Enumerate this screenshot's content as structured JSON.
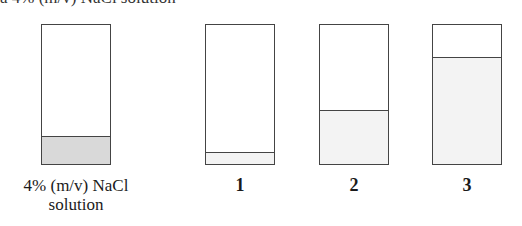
{
  "header": {
    "caption": "a 4% (m/v) NaCl solution"
  },
  "colors": {
    "outline": "#444444",
    "fill_reference": "#d9d9d9",
    "fill_test": "#f3f3f3"
  },
  "tubes": [
    {
      "id": "reference",
      "label_line1": "4% (m/v) NaCl",
      "label_line2": "solution",
      "fill_percent": 19
    },
    {
      "id": "1",
      "label_line1": "1",
      "label_line2": "",
      "fill_percent": 8
    },
    {
      "id": "2",
      "label_line1": "2",
      "label_line2": "",
      "fill_percent": 38
    },
    {
      "id": "3",
      "label_line1": "3",
      "label_line2": "",
      "fill_percent": 76
    }
  ]
}
